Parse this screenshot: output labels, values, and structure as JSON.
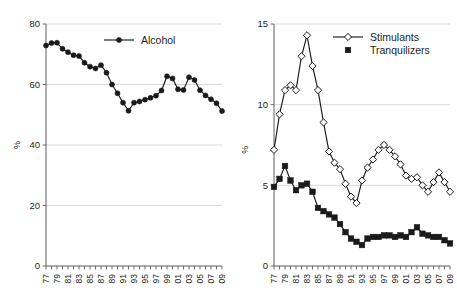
{
  "figure": {
    "width": 457,
    "height": 308,
    "background": "#ffffff",
    "ink_color": "#1a1a1a",
    "grid_color": "#c9c9c9",
    "axis_color": "#4d4d4d"
  },
  "chart_data": [
    {
      "panel": "left",
      "type": "line",
      "title": "",
      "xlabel": "",
      "ylabel": "%",
      "ylim": [
        0,
        80
      ],
      "yticks": [
        0,
        20,
        40,
        60,
        80
      ],
      "ytick_labels": [
        "0",
        "20",
        "40",
        "60",
        "80"
      ],
      "grid": true,
      "legend_position": "upper-center",
      "x": [
        "77",
        "78",
        "79",
        "80",
        "81",
        "82",
        "83",
        "84",
        "85",
        "86",
        "87",
        "88",
        "89",
        "90",
        "91",
        "92",
        "93",
        "94",
        "95",
        "96",
        "97",
        "98",
        "99",
        "00",
        "01",
        "02",
        "03",
        "04",
        "05",
        "06",
        "07",
        "08",
        "09"
      ],
      "xtick_labels": [
        "77",
        "79",
        "81",
        "83",
        "85",
        "87",
        "89",
        "91",
        "93",
        "95",
        "97",
        "99",
        "01",
        "03",
        "05",
        "07",
        "09"
      ],
      "series": [
        {
          "name": "Alcohol",
          "marker": "filled-circle",
          "values": [
            72.9,
            73.7,
            73.8,
            71.8,
            70.7,
            69.7,
            69.4,
            67.2,
            65.9,
            65.3,
            66.4,
            63.9,
            60.0,
            57.1,
            54.0,
            51.3,
            54.0,
            54.4,
            55.0,
            55.6,
            56.3,
            58.0,
            62.7,
            62.0,
            58.4,
            58.2,
            62.4,
            61.5,
            58.1,
            56.4,
            55.1,
            53.8,
            51.2
          ]
        }
      ]
    },
    {
      "panel": "right",
      "type": "line",
      "title": "",
      "xlabel": "",
      "ylabel": "%",
      "ylim": [
        0,
        15
      ],
      "yticks": [
        0,
        5,
        10,
        15
      ],
      "ytick_labels": [
        "0",
        "5",
        "10",
        "15"
      ],
      "grid": true,
      "legend_position": "upper-right",
      "x": [
        "77",
        "78",
        "79",
        "80",
        "81",
        "82",
        "83",
        "84",
        "85",
        "86",
        "87",
        "88",
        "89",
        "90",
        "91",
        "92",
        "93",
        "94",
        "95",
        "96",
        "97",
        "98",
        "99",
        "00",
        "01",
        "02",
        "03",
        "04",
        "05",
        "06",
        "07",
        "08",
        "09"
      ],
      "xtick_labels": [
        "77",
        "79",
        "81",
        "83",
        "85",
        "87",
        "89",
        "91",
        "93",
        "95",
        "97",
        "99",
        "01",
        "03",
        "05",
        "07",
        "09"
      ],
      "series": [
        {
          "name": "Stimulants",
          "marker": "open-diamond",
          "values": [
            7.2,
            9.4,
            10.9,
            11.2,
            10.9,
            13.0,
            14.3,
            12.4,
            10.9,
            8.9,
            7.1,
            6.4,
            6.0,
            5.1,
            4.3,
            3.9,
            5.3,
            6.1,
            6.6,
            7.2,
            7.5,
            7.2,
            6.8,
            6.3,
            5.6,
            5.4,
            5.5,
            5.0,
            4.6,
            5.2,
            5.8,
            5.2,
            4.6
          ]
        },
        {
          "name": "Tranquilizers",
          "marker": "filled-square",
          "values": [
            4.9,
            5.4,
            6.2,
            5.3,
            4.7,
            5.0,
            5.1,
            4.6,
            3.6,
            3.4,
            3.2,
            3.0,
            2.6,
            2.1,
            1.7,
            1.5,
            1.3,
            1.7,
            1.8,
            1.8,
            1.9,
            1.9,
            1.8,
            1.9,
            1.8,
            2.1,
            2.4,
            2.0,
            1.9,
            1.8,
            1.8,
            1.6,
            1.4
          ]
        }
      ]
    }
  ]
}
